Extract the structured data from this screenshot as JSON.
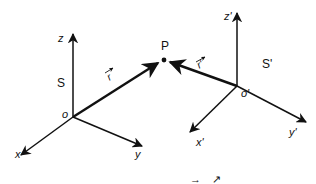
{
  "diagram": {
    "frame_s": {
      "name": "S",
      "origin_label": "o",
      "axes": {
        "x": "x",
        "y": "y",
        "z": "z"
      }
    },
    "frame_s_prime": {
      "name": "S'",
      "origin_label": "o'",
      "axes": {
        "x": "x'",
        "y": "y'",
        "z": "z'"
      }
    },
    "point": {
      "label": "P"
    },
    "vectors": {
      "r": {
        "label": "r",
        "arrow": "→"
      },
      "r_prime": {
        "label": "r'",
        "arrow": "→"
      }
    },
    "caption_fragment": {
      "left": "→",
      "right": "↗"
    },
    "colors": {
      "ink": "#111111",
      "background": "#ffffff"
    }
  }
}
